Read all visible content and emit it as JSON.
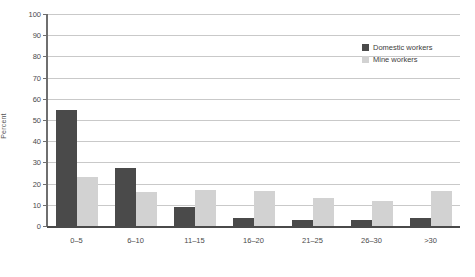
{
  "chart_data": {
    "type": "bar",
    "title": "",
    "xlabel": "",
    "ylabel": "Percent",
    "ylim": [
      0,
      100
    ],
    "ytick_step": 10,
    "yticks": [
      0,
      10,
      20,
      30,
      40,
      50,
      60,
      70,
      80,
      90,
      100
    ],
    "grid": true,
    "legend_position": "top-right",
    "categories": [
      "0–5",
      "6–10",
      "11–15",
      "16–20",
      "21–25",
      "26–30",
      ">30"
    ],
    "series": [
      {
        "name": "Domestic workers",
        "color": "#4a4a4a",
        "values": [
          54.5,
          27.5,
          9,
          4,
          3,
          3,
          4
        ]
      },
      {
        "name": "Mine workers",
        "color": "#d2d2d2",
        "values": [
          23,
          16,
          17,
          16.5,
          13,
          12,
          16.5
        ]
      }
    ]
  }
}
